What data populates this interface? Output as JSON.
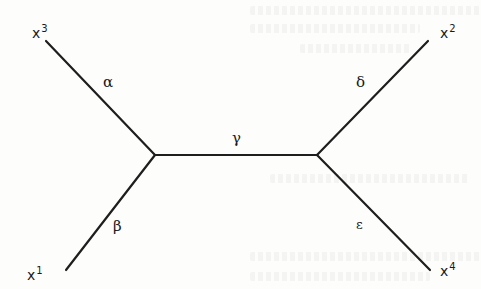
{
  "diagram": {
    "type": "unrooted-phylogenetic-tree",
    "colors": {
      "edge": "#1e1e1e",
      "text": "#1a1a1a",
      "background": "#fdfdfc"
    },
    "internal_nodes": [
      {
        "id": "left",
        "x": 155,
        "y": 155
      },
      {
        "id": "right",
        "x": 317,
        "y": 155
      }
    ],
    "leaves": [
      {
        "id": "x3",
        "base": "x",
        "sup": "3",
        "x": 46,
        "y": 41,
        "label_x": 32,
        "label_y": 24,
        "attached_to": "left"
      },
      {
        "id": "x1",
        "base": "x",
        "sup": "1",
        "x": 66,
        "y": 270,
        "label_x": 27,
        "label_y": 266,
        "attached_to": "left"
      },
      {
        "id": "x2",
        "base": "x",
        "sup": "2",
        "x": 428,
        "y": 41,
        "label_x": 440,
        "label_y": 24,
        "attached_to": "right"
      },
      {
        "id": "x4",
        "base": "x",
        "sup": "4",
        "x": 430,
        "y": 270,
        "label_x": 440,
        "label_y": 262,
        "attached_to": "right"
      }
    ],
    "edges": [
      {
        "id": "alpha",
        "label": "α",
        "from": "x3",
        "to": "left",
        "label_x": 103,
        "label_y": 75
      },
      {
        "id": "beta",
        "label": "β",
        "from": "x1",
        "to": "left",
        "label_x": 113,
        "label_y": 219
      },
      {
        "id": "gamma",
        "label": "γ",
        "from": "left",
        "to": "right",
        "label_x": 232,
        "label_y": 131
      },
      {
        "id": "delta",
        "label": "δ",
        "from": "x2",
        "to": "right",
        "label_x": 356,
        "label_y": 75
      },
      {
        "id": "epsilon",
        "label": "ε",
        "from": "x4",
        "to": "right",
        "label_x": 356,
        "label_y": 218
      }
    ]
  }
}
